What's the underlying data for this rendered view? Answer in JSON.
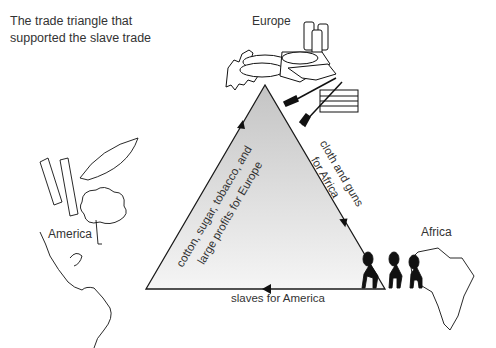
{
  "caption": "The trade triangle that supported the slave trade",
  "regions": {
    "europe": "Europe",
    "america": "America",
    "africa": "Africa"
  },
  "edges": {
    "america_to_europe": {
      "line1": "cotton, sugar, tobacco, and",
      "line2": "large profits for Europe"
    },
    "europe_to_africa": {
      "line1": "cloth and guns",
      "line2": "for Africa"
    },
    "africa_to_america": {
      "line1": "slaves for America"
    }
  },
  "illustrations": {
    "europe": [
      "europe-map",
      "cloth-rolls",
      "fabric-bales",
      "guns",
      "crate"
    ],
    "america": [
      "americas-map",
      "sugar-cane",
      "tobacco-leaf",
      "cotton-plant"
    ],
    "africa": [
      "africa-map",
      "enslaved-people"
    ]
  },
  "colors": {
    "triangle_fill_top": "#c8c8c8",
    "triangle_fill_bottom": "#f4f4f4",
    "line": "#1a1a1a"
  }
}
